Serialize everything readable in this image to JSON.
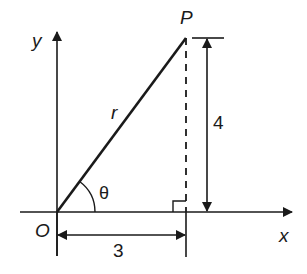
{
  "diagram": {
    "type": "right-triangle-polar-coordinates",
    "labels": {
      "y_axis": "y",
      "x_axis": "x",
      "origin": "O",
      "point": "P",
      "hypotenuse": "r",
      "angle": "θ",
      "height": "4",
      "base": "3"
    },
    "values": {
      "x": 3,
      "y": 4
    },
    "colors": {
      "stroke": "#1a1a1a",
      "background": "#ffffff"
    }
  }
}
